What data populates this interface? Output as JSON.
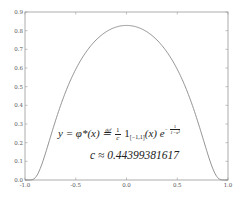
{
  "chart_data": {
    "type": "line",
    "title": "",
    "xlabel": "",
    "ylabel": "",
    "xlim": [
      -1.0,
      1.0
    ],
    "ylim": [
      0.0,
      0.9
    ],
    "grid": false,
    "x_ticks": [
      "-1.0",
      "-0.5",
      "0.0",
      "0.5",
      "1.0"
    ],
    "y_ticks": [
      "0.0",
      "0.1",
      "0.2",
      "0.3",
      "0.4",
      "0.5",
      "0.6",
      "0.7",
      "0.8",
      "0.9"
    ],
    "series": [
      {
        "name": "phi*(x) mollifier",
        "color": "#888888",
        "x": [
          -1.0,
          -0.95,
          -0.9,
          -0.85,
          -0.8,
          -0.75,
          -0.7,
          -0.6,
          -0.5,
          -0.4,
          -0.3,
          -0.2,
          -0.1,
          0.0,
          0.1,
          0.2,
          0.3,
          0.4,
          0.5,
          0.6,
          0.7,
          0.75,
          0.8,
          0.85,
          0.9,
          0.95,
          1.0
        ],
        "values": [
          0.0,
          0.0,
          0.012,
          0.049,
          0.104,
          0.166,
          0.23,
          0.346,
          0.446,
          0.548,
          0.658,
          0.734,
          0.79,
          0.828,
          0.79,
          0.734,
          0.658,
          0.548,
          0.446,
          0.346,
          0.23,
          0.166,
          0.104,
          0.049,
          0.012,
          0.0,
          0.0
        ]
      }
    ],
    "annotations": [
      "y = φ*(x) ≝ 1/c 1[−1,1](x) e^(−1/(1−x²))",
      "c ≈ 0.44399381617"
    ]
  },
  "formula": {
    "lhs": "y = φ*(x) ≝ ",
    "frac_num": "1",
    "frac_den": "c",
    "indicator": " 1",
    "indicator_sub": "[−1,1]",
    "arg": "(x) e",
    "exp_minus": "−",
    "exp_num": "1",
    "exp_den": "1−x²"
  },
  "constant": {
    "text": "c ≈ 0.44399381617"
  }
}
